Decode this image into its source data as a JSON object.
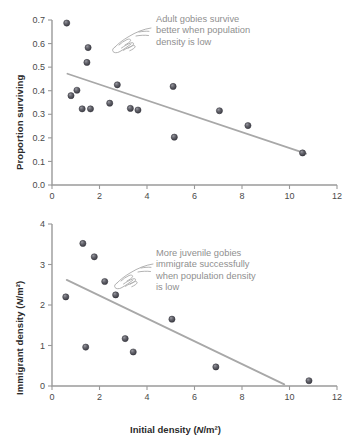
{
  "figure": {
    "xlabel_text": "Initial density (",
    "xlabel_italic": "N",
    "xlabel_tail": "/m²)"
  },
  "chart_data": [
    {
      "type": "scatter",
      "panel": "top",
      "title": "",
      "xlabel": "Initial density (N/m²)",
      "ylabel": "Proportion surviving",
      "xlim": [
        0,
        12
      ],
      "ylim": [
        0.0,
        0.7
      ],
      "xticks": [
        0,
        2,
        4,
        6,
        8,
        10,
        12
      ],
      "xtick_labels": [
        "0",
        "2",
        "4",
        "6",
        "8",
        "10",
        "12"
      ],
      "yticks": [
        0.0,
        0.1,
        0.2,
        0.3,
        0.4,
        0.5,
        0.6,
        0.7
      ],
      "ytick_labels": [
        "0.0",
        "0.1",
        "0.2",
        "0.3",
        "0.4",
        "0.5",
        "0.6",
        "0.7"
      ],
      "grid": false,
      "legend": null,
      "marker_color": "#59595f",
      "points": [
        {
          "x": 0.62,
          "y": 0.687
        },
        {
          "x": 0.8,
          "y": 0.379
        },
        {
          "x": 1.05,
          "y": 0.402
        },
        {
          "x": 1.27,
          "y": 0.323
        },
        {
          "x": 1.47,
          "y": 0.52
        },
        {
          "x": 1.52,
          "y": 0.583
        },
        {
          "x": 1.62,
          "y": 0.323
        },
        {
          "x": 2.43,
          "y": 0.347
        },
        {
          "x": 2.75,
          "y": 0.425
        },
        {
          "x": 3.3,
          "y": 0.325
        },
        {
          "x": 3.62,
          "y": 0.318
        },
        {
          "x": 5.1,
          "y": 0.418
        },
        {
          "x": 5.15,
          "y": 0.203
        },
        {
          "x": 7.05,
          "y": 0.315
        },
        {
          "x": 8.25,
          "y": 0.252
        },
        {
          "x": 10.55,
          "y": 0.136
        }
      ],
      "trend": {
        "x0": 0.65,
        "y0": 0.472,
        "x1": 10.7,
        "y1": 0.133
      },
      "annotation": "Adult gobies survive\nbetter when population\ndensity is low",
      "annotation_color": "#8f8f8f"
    },
    {
      "type": "scatter",
      "panel": "bottom",
      "title": "",
      "xlabel": "Initial density (N/m²)",
      "ylabel": "Immigrant density (N/m²)",
      "xlim": [
        0,
        12
      ],
      "ylim": [
        0,
        4
      ],
      "xticks": [
        0,
        2,
        4,
        6,
        8,
        10,
        12
      ],
      "xtick_labels": [
        "0",
        "2",
        "4",
        "6",
        "8",
        "10",
        "12"
      ],
      "yticks": [
        0,
        1,
        2,
        3,
        4
      ],
      "ytick_labels": [
        "0",
        "1",
        "2",
        "3",
        "4"
      ],
      "grid": false,
      "legend": null,
      "marker_color": "#59595f",
      "points": [
        {
          "x": 0.58,
          "y": 2.2
        },
        {
          "x": 1.3,
          "y": 3.52
        },
        {
          "x": 1.42,
          "y": 0.96
        },
        {
          "x": 1.78,
          "y": 3.19
        },
        {
          "x": 2.22,
          "y": 2.58
        },
        {
          "x": 2.68,
          "y": 2.25
        },
        {
          "x": 3.08,
          "y": 1.17
        },
        {
          "x": 3.42,
          "y": 0.84
        },
        {
          "x": 5.05,
          "y": 1.65
        },
        {
          "x": 6.9,
          "y": 0.47
        },
        {
          "x": 10.82,
          "y": 0.13
        }
      ],
      "trend": {
        "x0": 0.62,
        "y0": 2.62,
        "x1": 9.78,
        "y1": 0.04
      },
      "annotation": "More juvenile gobies\nimmigrate successfully\nwhen population density\nis low",
      "annotation_color": "#8f8f8f"
    }
  ]
}
